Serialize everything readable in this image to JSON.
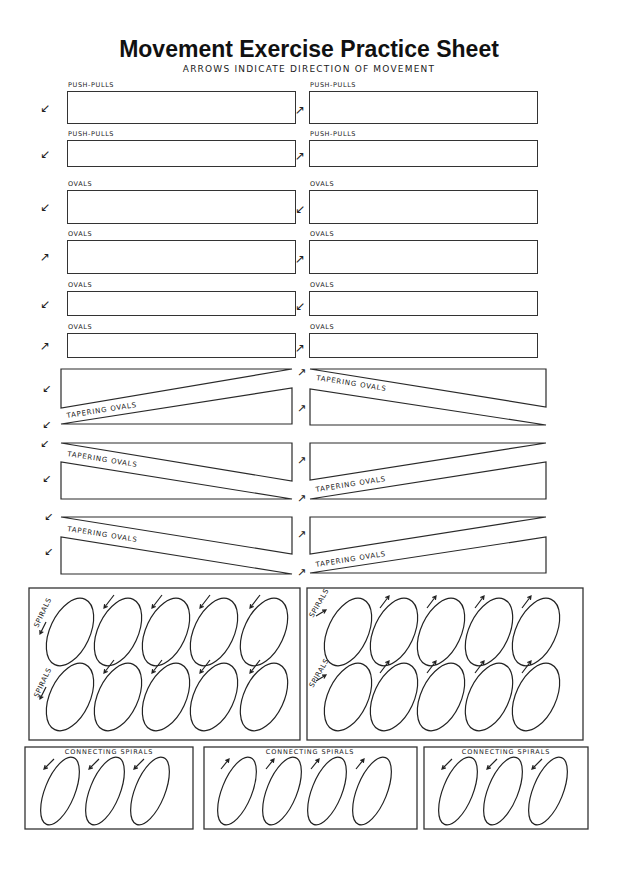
{
  "header": {
    "title": "Movement Exercise Practice Sheet",
    "subtitle": "ARROWS INDICATE DIRECTION OF MOVEMENT"
  },
  "rect_rows": [
    {
      "left_label": "PUSH-PULLS",
      "right_label": "PUSH-PULLS",
      "left_arrow": "↙",
      "right_arrow": "↗"
    },
    {
      "left_label": "PUSH-PULLS",
      "right_label": "PUSH-PULLS",
      "left_arrow": "↙",
      "right_arrow": "↗"
    },
    {
      "left_label": "OVALS",
      "right_label": "OVALS",
      "left_arrow": "↙",
      "right_arrow": "↙"
    },
    {
      "left_label": "OVALS",
      "right_label": "OVALS",
      "left_arrow": "↗",
      "right_arrow": "↗"
    },
    {
      "left_label": "OVALS",
      "right_label": "OVALS",
      "left_arrow": "↙",
      "right_arrow": "↙"
    },
    {
      "left_label": "OVALS",
      "right_label": "OVALS",
      "left_arrow": "↗",
      "right_arrow": "↗"
    }
  ],
  "tapering": {
    "label": "TAPERING OVALS",
    "left_arrow": "↙",
    "right_arrow": "↗"
  },
  "spirals": {
    "label": "SPIRALS",
    "left_panel_direction": "counterclockwise",
    "right_panel_direction": "clockwise",
    "rows": 2,
    "ovals_per_row": 5
  },
  "connecting_spirals": {
    "label": "CONNECTING SPIRALS",
    "panels": [
      {
        "ovals": 3,
        "direction": "down-left"
      },
      {
        "ovals": 4,
        "direction": "up-right"
      },
      {
        "ovals": 3,
        "direction": "down-left"
      }
    ]
  }
}
